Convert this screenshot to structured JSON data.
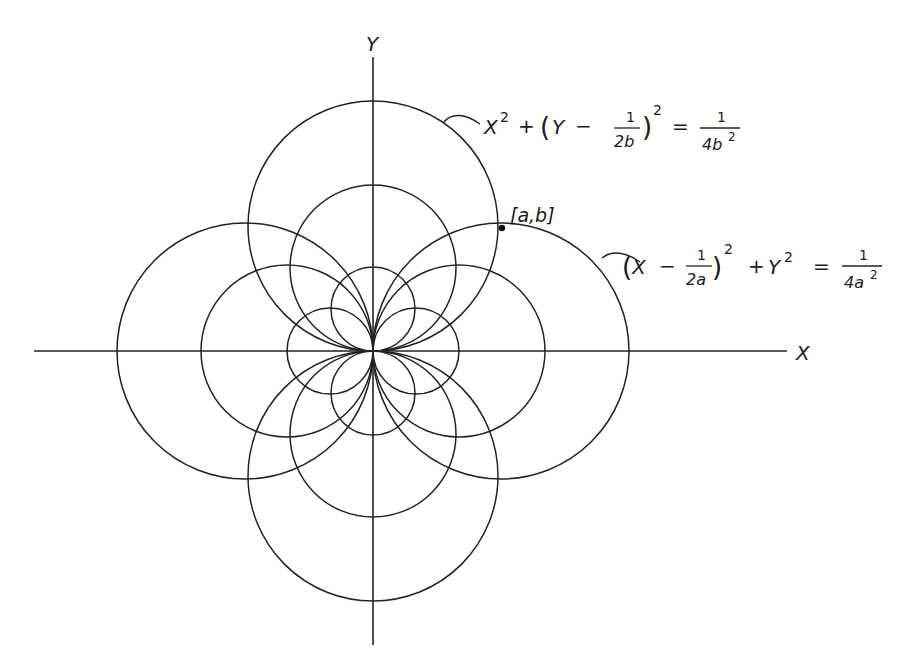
{
  "figure": {
    "axes": {
      "x_label": "X",
      "y_label": "Y"
    },
    "point": {
      "label": "[a,b]"
    },
    "equations": {
      "vertical_circle": {
        "lhs_x2": "X",
        "lhs_x2_exp": "2",
        "plus": "+",
        "lparen": "(",
        "var": "Y",
        "minus": "−",
        "frac_num": "1",
        "frac_den": "2b",
        "rparen": ")",
        "paren_exp": "2",
        "equals": "=",
        "rhs_num": "1",
        "rhs_den": "4b",
        "rhs_den_exp": "2"
      },
      "horizontal_circle": {
        "lparen": "(",
        "var": "X",
        "minus": "−",
        "frac_num": "1",
        "frac_den": "2a",
        "rparen": ")",
        "paren_exp": "2",
        "plus": "+",
        "rhs_var": "Y",
        "rhs_var_exp": "2",
        "equals": "=",
        "rhs_num": "1",
        "rhs_den": "4a",
        "rhs_den_exp": "2"
      }
    },
    "circle_families": {
      "vertical_tangent_to_x_axis_at_origin": [
        "large",
        "medium",
        "small"
      ],
      "horizontal_tangent_to_y_axis_at_origin": [
        "large",
        "medium",
        "small"
      ]
    }
  }
}
